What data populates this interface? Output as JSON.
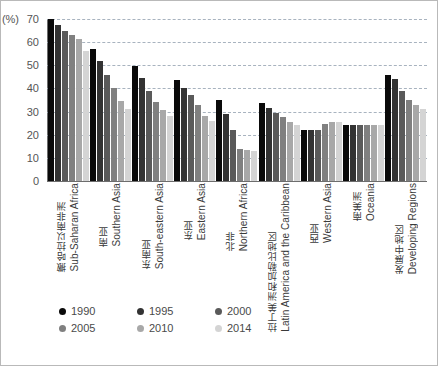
{
  "chart_data": {
    "type": "bar",
    "title": "",
    "subtitle": "",
    "xlabel": "",
    "ylabel": "(%)",
    "ylim": [
      0,
      70
    ],
    "ytick_step": 10,
    "yticks": [
      0,
      10,
      20,
      30,
      40,
      50,
      60,
      70
    ],
    "grid": true,
    "legend_position": "bottom-left",
    "categories": [
      "Sub-Saharan Africa",
      "Southern Asia",
      "South-eastern Asia",
      "Eastern Asia",
      "Northern Africa",
      "Latin America and the Caribbean",
      "Western Asia",
      "Oceania",
      "Developing Regions"
    ],
    "categories_zh": [
      "撒哈拉以南非洲",
      "南亚",
      "东南亚",
      "东亚",
      "北非",
      "拉丁美洲和加勒比地区",
      "西亚",
      "南美洲",
      "发展中地区"
    ],
    "series": [
      {
        "name": "1990",
        "color": "#0a0a0a",
        "values": [
          70,
          57,
          49.5,
          43.5,
          35,
          33.5,
          22,
          24,
          46
        ]
      },
      {
        "name": "1995",
        "color": "#333333",
        "values": [
          67.5,
          52,
          44.5,
          40,
          29,
          31.5,
          22,
          24,
          44
        ]
      },
      {
        "name": "2000",
        "color": "#5a5a5a",
        "values": [
          65,
          46,
          39,
          37,
          22,
          29.5,
          22,
          24,
          39
        ]
      },
      {
        "name": "2005",
        "color": "#808080",
        "values": [
          63,
          40,
          34,
          33,
          14,
          27.5,
          24.5,
          24,
          35
        ]
      },
      {
        "name": "2010",
        "color": "#a8a8a8",
        "values": [
          61.5,
          34.5,
          30.5,
          28,
          13.5,
          25.5,
          25.5,
          24,
          33
        ]
      },
      {
        "name": "2014",
        "color": "#d4d4d4",
        "values": [
          56,
          31,
          28,
          26,
          13,
          24,
          25.5,
          24,
          31
        ]
      }
    ]
  },
  "legend": {
    "items": [
      {
        "label": "1990",
        "color": "#0a0a0a"
      },
      {
        "label": "1995",
        "color": "#333333"
      },
      {
        "label": "2000",
        "color": "#5a5a5a"
      },
      {
        "label": "2005",
        "color": "#808080"
      },
      {
        "label": "2010",
        "color": "#a8a8a8"
      },
      {
        "label": "2014",
        "color": "#d4d4d4"
      }
    ]
  },
  "axis": {
    "unit_label": "(%)",
    "y_tick_labels": [
      "70",
      "60",
      "50",
      "40",
      "30",
      "20",
      "10",
      "0"
    ]
  }
}
